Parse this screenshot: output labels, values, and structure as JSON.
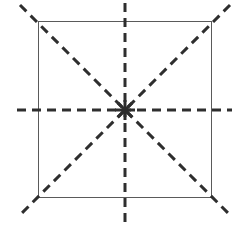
{
  "figure": {
    "canvas": {
      "width": 249,
      "height": 230,
      "background": "#ffffff"
    },
    "colors": {
      "shape_stroke": "#5a5a5a",
      "axis_stroke": "#2e2e2e",
      "background": "#ffffff"
    }
  },
  "chart_data": {
    "type": "diagram",
    "subtitle": "",
    "xlabel": "",
    "ylabel": "",
    "grid": false,
    "legend": null,
    "annotations": [],
    "tick_labels": [],
    "coordinate_space": {
      "x_range": [
        0,
        249
      ],
      "y_range": [
        0,
        230
      ],
      "units": "px"
    },
    "shapes": [
      {
        "name": "square",
        "kind": "rectangle",
        "stroke": "#5a5a5a",
        "stroke_width": 1,
        "fill": "none",
        "dash": "solid",
        "x": 38,
        "y": 21,
        "width": 174,
        "height": 177,
        "corners": [
          [
            38,
            21
          ],
          [
            212,
            21
          ],
          [
            212,
            198
          ],
          [
            38,
            198
          ]
        ]
      }
    ],
    "center_point": {
      "name": "center-of-symmetry",
      "x": 125,
      "y": 110
    },
    "symmetry_axes": [
      {
        "name": "vertical-axis",
        "orientation": "vertical",
        "angle_deg": 90,
        "x1": 125,
        "y1": 3,
        "x2": 125,
        "y2": 227,
        "stroke": "#2e2e2e",
        "stroke_width": 3,
        "dash_length": 9,
        "gap_length": 6
      },
      {
        "name": "horizontal-axis",
        "orientation": "horizontal",
        "angle_deg": 0,
        "x1": 17,
        "y1": 110,
        "x2": 232,
        "y2": 110,
        "stroke": "#2e2e2e",
        "stroke_width": 3,
        "dash_length": 9,
        "gap_length": 6
      },
      {
        "name": "main-diagonal-axis",
        "orientation": "diagonal-nwse",
        "angle_deg": -45,
        "x1": 20,
        "y1": 5,
        "x2": 230,
        "y2": 215,
        "stroke": "#2e2e2e",
        "stroke_width": 3,
        "dash_length": 9,
        "gap_length": 6
      },
      {
        "name": "anti-diagonal-axis",
        "orientation": "diagonal-nesw",
        "angle_deg": 45,
        "x1": 230,
        "y1": 5,
        "x2": 20,
        "y2": 215,
        "stroke": "#2e2e2e",
        "stroke_width": 3,
        "dash_length": 9,
        "gap_length": 6
      }
    ],
    "axis_count": 4
  }
}
